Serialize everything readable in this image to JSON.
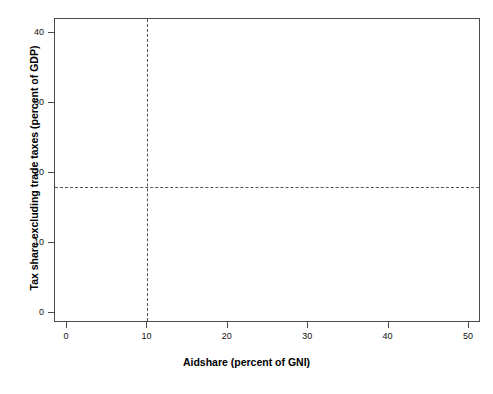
{
  "chart_data": {
    "type": "scatter",
    "title": "",
    "xlabel": "Aidshare (percent of GNI)",
    "ylabel": "Tax share excluding trade taxes (percent of GDP)",
    "xlim": [
      -1.5,
      51.5
    ],
    "ylim": [
      -1.5,
      42.0
    ],
    "xticks": [
      0,
      10,
      20,
      30,
      40,
      50
    ],
    "yticks": [
      0,
      10,
      20,
      30,
      40
    ],
    "grid": false,
    "legend": null,
    "marker": "triangle-up",
    "marker_color": "#111111",
    "reference_lines": [
      {
        "orientation": "vertical",
        "value": 10,
        "style": "dashed"
      },
      {
        "orientation": "horizontal",
        "value": 18,
        "style": "dashed"
      }
    ],
    "labeled_points": [
      {
        "label": "Bulgaria",
        "x": 3.0,
        "y": 35.9,
        "lx": 6,
        "ly": 0
      },
      {
        "label": "Guyana",
        "x": 9.0,
        "y": 36.3,
        "lx": 6,
        "ly": 0
      },
      {
        "label": "Guyana",
        "x": 9.6,
        "y": 31.9,
        "lx": 6,
        "ly": 0
      },
      {
        "label": "Belarus",
        "x": 2.6,
        "y": 28.9,
        "lx": 6,
        "ly": -6
      },
      {
        "label": "Nicaragua",
        "x": 6.4,
        "y": 28.0,
        "lx": 6,
        "ly": 0
      },
      {
        "label": "Belarus",
        "x": 2.2,
        "y": 26.8,
        "lx": 6,
        "ly": 0
      },
      {
        "label": "Jamaica",
        "x": 8.8,
        "y": 26.4,
        "lx": 3,
        "ly": -7
      },
      {
        "label": "Bulgaria",
        "x": 3.2,
        "y": 25.1,
        "lx": 6,
        "ly": 0
      },
      {
        "label": "Jamaica",
        "x": 8.6,
        "y": 24.7,
        "lx": 3,
        "ly": 0
      },
      {
        "label": "Bulgaria",
        "x": 4.0,
        "y": 24.0,
        "lx": 6,
        "ly": 0
      },
      {
        "label": "South Africa",
        "x": 1.0,
        "y": 23.6,
        "lx": 5,
        "ly": 0
      },
      {
        "label": "Guyana",
        "x": 6.2,
        "y": 23.8,
        "lx": 6,
        "ly": 0
      },
      {
        "label": "Congo",
        "x": 6.6,
        "y": 22.8,
        "lx": 6,
        "ly": 0
      },
      {
        "label": "Jamaica",
        "x": 3.0,
        "y": 21.6,
        "lx": 6,
        "ly": 0
      },
      {
        "label": "Zimbabwe",
        "x": 3.2,
        "y": 20.6,
        "lx": 6,
        "ly": 0
      },
      {
        "label": "Zambia",
        "x": 8.0,
        "y": 19.9,
        "lx": 6,
        "ly": 0
      },
      {
        "label": "Brazil",
        "x": 0.6,
        "y": 19.0,
        "lx": 5,
        "ly": 0
      },
      {
        "label": "Zimbabwe",
        "x": 8.6,
        "y": 18.7,
        "lx": 6,
        "ly": 0
      },
      {
        "label": "Egypt",
        "x": 5.6,
        "y": 17.9,
        "lx": 6,
        "ly": 0
      },
      {
        "label": "Egypt",
        "x": 10.6,
        "y": 16.4,
        "lx": 6,
        "ly": 0
      },
      {
        "label": "Egypt",
        "x": 13.2,
        "y": 16.4,
        "lx": 6,
        "ly": 0
      },
      {
        "label": "Mongolia",
        "x": 21.0,
        "y": 16.3,
        "lx": 6,
        "ly": 0
      },
      {
        "label": "Togo",
        "x": 10.8,
        "y": 15.5,
        "lx": 6,
        "ly": 0
      },
      {
        "label": "Suriname",
        "x": 13.4,
        "y": 15.5,
        "lx": 6,
        "ly": 0
      },
      {
        "label": "Zambia",
        "x": 20.8,
        "y": 15.3,
        "lx": 6,
        "ly": 0
      },
      {
        "label": "Nicaragua",
        "x": 28.8,
        "y": 17.3,
        "lx": 6,
        "ly": 0
      },
      {
        "label": "Nicaragua",
        "x": 34.0,
        "y": 16.5,
        "lx": 6,
        "ly": 0
      },
      {
        "label": "Togo",
        "x": 6.0,
        "y": 15.6,
        "lx": 6,
        "ly": 0
      },
      {
        "label": "Suriname",
        "x": 12.2,
        "y": 14.6,
        "lx": 6,
        "ly": 0
      },
      {
        "label": "Togo",
        "x": 14.6,
        "y": 14.5,
        "lx": 6,
        "ly": 0
      },
      {
        "label": "Mongolia",
        "x": 22.6,
        "y": 14.4,
        "lx": 6,
        "ly": 0
      },
      {
        "label": "Liberia",
        "x": 8.4,
        "y": 13.8,
        "lx": 6,
        "ly": 0
      },
      {
        "label": "Lesotho",
        "x": 15.2,
        "y": 13.6,
        "lx": 6,
        "ly": 0
      },
      {
        "label": "Zambia",
        "x": 18.4,
        "y": 13.7,
        "lx": 6,
        "ly": 0
      },
      {
        "label": "Burundi",
        "x": 22.0,
        "y": 13.3,
        "lx": 6,
        "ly": 0
      },
      {
        "label": "Burundi",
        "x": 26.4,
        "y": 12.9,
        "lx": 6,
        "ly": 0
      },
      {
        "label": "Sri Lanka",
        "x": 11.4,
        "y": 13.2,
        "lx": 6,
        "ly": 0
      },
      {
        "label": "Senegal",
        "x": 14.4,
        "y": 12.9,
        "lx": 6,
        "ly": 0
      },
      {
        "label": "Punjab",
        "x": 16.0,
        "y": 12.0,
        "lx": 6,
        "ly": 0
      },
      {
        "label": "Mali",
        "x": 20.8,
        "y": 11.9,
        "lx": 6,
        "ly": 0
      },
      {
        "label": "Mali",
        "x": 15.4,
        "y": 11.1,
        "lx": 6,
        "ly": 0
      },
      {
        "label": "Burundi",
        "x": 16.6,
        "y": 10.4,
        "lx": 6,
        "ly": 0
      },
      {
        "label": "Gambia",
        "x": 24.6,
        "y": 11.8,
        "lx": 6,
        "ly": 0
      },
      {
        "label": "Mauritania",
        "x": 25.8,
        "y": 11.0,
        "lx": 4,
        "ly": 0
      },
      {
        "label": "Vanuatu",
        "x": 21.6,
        "y": 10.1,
        "lx": 6,
        "ly": 0
      },
      {
        "label": "Mali",
        "x": 23.0,
        "y": 10.2,
        "lx": 4,
        "ly": 0
      },
      {
        "label": "Vanuatu",
        "x": 29.4,
        "y": 9.5,
        "lx": 6,
        "ly": 0
      },
      {
        "label": "Vanuatu",
        "x": 32.8,
        "y": 9.3,
        "lx": 5,
        "ly": 0
      },
      {
        "label": "Bhutan",
        "x": 13.8,
        "y": 9.3,
        "lx": 6,
        "ly": 0
      },
      {
        "label": "Burkina Faso",
        "x": 17.6,
        "y": 8.6,
        "lx": 6,
        "ly": 0
      },
      {
        "label": "Bhutan",
        "x": 14.6,
        "y": 8.3,
        "lx": 6,
        "ly": 0
      },
      {
        "label": "Tonga",
        "x": 15.2,
        "y": 7.7,
        "lx": 6,
        "ly": 0
      },
      {
        "label": "Rwanda",
        "x": 37.6,
        "y": 9.6,
        "lx": 6,
        "ly": 0
      },
      {
        "label": "Gambia",
        "x": 18.0,
        "y": 7.4,
        "lx": 6,
        "ly": 0
      },
      {
        "label": "Gambia",
        "x": 24.8,
        "y": 7.8,
        "lx": 6,
        "ly": 0
      },
      {
        "label": "Tonga",
        "x": 17.0,
        "y": 6.8,
        "lx": 6,
        "ly": 0
      },
      {
        "label": "Tonga",
        "x": 19.8,
        "y": 6.6,
        "lx": 6,
        "ly": 0
      },
      {
        "label": "Vanuatu",
        "x": 34.6,
        "y": 6.5,
        "lx": 6,
        "ly": 0
      },
      {
        "label": "Gambia",
        "x": 40.6,
        "y": 6.7,
        "lx": 6,
        "ly": 0
      },
      {
        "label": "Madagascar",
        "x": 12.4,
        "y": 6.9,
        "lx": 6,
        "ly": 0
      },
      {
        "label": "Rwanda",
        "x": 13.0,
        "y": 5.9,
        "lx": 6,
        "ly": 0
      },
      {
        "label": "Nepal",
        "x": 5.0,
        "y": 6.1,
        "lx": 6,
        "ly": 0
      },
      {
        "label": "Nepal",
        "x": 3.0,
        "y": 4.7,
        "lx": 6,
        "ly": 0
      },
      {
        "label": "Chad",
        "x": 8.8,
        "y": 4.8,
        "lx": 6,
        "ly": 0
      },
      {
        "label": "Gambia",
        "x": 8.8,
        "y": 3.8,
        "lx": 6,
        "ly": 0
      }
    ],
    "cloud_description": "Dense overlapping cluster of unlabeled country-year observations concentrated between aidshare 0-15 percent of GNI and tax share 2-20 percent of GDP"
  },
  "axes": {
    "x": {
      "label": "Aidshare (percent of GNI)",
      "ticks": [
        "0",
        "10",
        "20",
        "30",
        "40",
        "50"
      ]
    },
    "y": {
      "label": "Tax share excluding trade taxes (percent of GDP)",
      "ticks": [
        "0",
        "10",
        "20",
        "30",
        "40"
      ]
    }
  }
}
